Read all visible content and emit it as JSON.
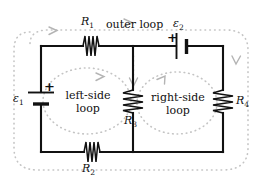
{
  "figure": {
    "kind": "circuit-diagram",
    "wire_color": "#111111",
    "loop_color": "#c4c4c4",
    "background": "#ffffff"
  },
  "components": {
    "r1": {
      "label": "R",
      "sub": "1",
      "type": "resistor",
      "orientation": "horizontal"
    },
    "r2": {
      "label": "R",
      "sub": "2",
      "type": "resistor",
      "orientation": "horizontal"
    },
    "r3": {
      "label": "R",
      "sub": "3",
      "type": "resistor",
      "orientation": "vertical"
    },
    "r4": {
      "label": "R",
      "sub": "4",
      "type": "resistor",
      "orientation": "vertical"
    },
    "emf1": {
      "label": "ε",
      "sub": "1",
      "type": "battery",
      "orientation": "vertical",
      "polarity": "+"
    },
    "emf2": {
      "label": "ε",
      "sub": "2",
      "type": "battery",
      "orientation": "horizontal",
      "polarity": "+"
    }
  },
  "loops": {
    "outer": {
      "name": "outer loop",
      "style": "dotted",
      "direction": "clockwise"
    },
    "left": {
      "name_line1": "left-side",
      "name_line2": "loop",
      "style": "dotted",
      "direction": "clockwise"
    },
    "right": {
      "name_line1": "right-side",
      "name_line2": "loop",
      "style": "dotted",
      "direction": "clockwise"
    }
  }
}
